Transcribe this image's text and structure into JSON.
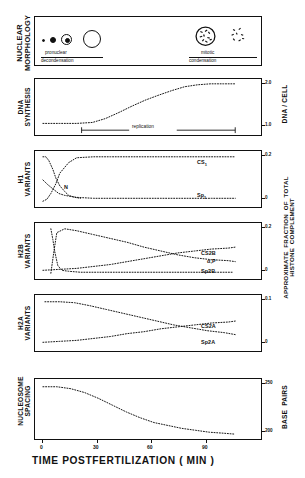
{
  "figure": {
    "xaxis_title": "TIME  POSTFERTILIZATION  ( MIN )",
    "x_ticks": [
      "0",
      "30",
      "60",
      "90"
    ],
    "x_range": [
      -5,
      100
    ]
  },
  "panels": {
    "nuclear_morphology": {
      "left_label": "NUCLEAR\nMORPHOLOGY",
      "caption_left_top": "pronuclear",
      "caption_left_bottom": "decondensation",
      "caption_right_top": "mitotic",
      "caption_right_bottom": "condensation"
    },
    "dna_synthesis": {
      "left_label": "DNA\nSYNTHESIS",
      "right_label": "DNA / CELL",
      "right_ticks": [
        "2.0",
        "1.0"
      ],
      "annotation": "replication"
    },
    "h1_variants": {
      "left_label": "H1\nVARIANTS",
      "right_ticks": [
        "0.2",
        "0"
      ],
      "curve_labels": [
        "CS",
        "Sp",
        "N"
      ],
      "curve_label_cs": "CS",
      "curve_label_cs_sub": "1",
      "curve_label_sp": "Sp",
      "curve_label_sp_sub": "1",
      "curve_label_n": "N"
    },
    "h2b_variants": {
      "left_label": "H2B\nVARIANTS",
      "right_ticks": [
        "0.2",
        "0"
      ],
      "curve_label_cs2b": "CS2B",
      "curve_label_ap": "α,P",
      "curve_label_sp2b": "Sp2B"
    },
    "h2a_variants": {
      "left_label": "H2A\nVARIANTS",
      "right_label": "APPROXIMATE  FRACTION  OF  TOTAL\nHISTONE  COMPLEMENT",
      "right_ticks": [
        "0.1",
        "0"
      ],
      "curve_label_cs2a": "CS2A",
      "curve_label_sp2a": "Sp2A"
    },
    "nucleosome_spacing": {
      "left_label": "NUCLEOSOME\nSPACING",
      "right_label": "BASE  PAIRS",
      "right_ticks": [
        "250",
        "200"
      ]
    }
  },
  "chart_data": {
    "type": "line",
    "title": "",
    "xlabel": "TIME  POSTFERTILIZATION  ( MIN )",
    "xlim": [
      -5,
      100
    ],
    "grid": false,
    "subplots": [
      {
        "name": "dna_synthesis",
        "ylabel": "DNA / CELL",
        "ylim": [
          0.75,
          2.25
        ],
        "yticks": [
          1.0,
          2.0
        ],
        "series": [
          {
            "name": "DNA per cell",
            "style": "dotted",
            "x": [
              0,
              8,
              16,
              24,
              30,
              36,
              42,
              48,
              54,
              60,
              66,
              72,
              78,
              84,
              90
            ],
            "y": [
              1.0,
              1.0,
              1.0,
              1.02,
              1.1,
              1.25,
              1.4,
              1.54,
              1.68,
              1.8,
              1.9,
              1.96,
              2.0,
              2.0,
              2.0
            ]
          }
        ],
        "annotations": [
          {
            "text": "replication",
            "x_start": 26,
            "x_end": 90,
            "y": 0.82
          }
        ]
      },
      {
        "name": "h1_variants",
        "ylim": [
          0,
          0.24
        ],
        "yticks": [
          0,
          0.2
        ],
        "series": [
          {
            "name": "CS1",
            "style": "dotted",
            "x": [
              0,
              3,
              6,
              9,
              12,
              18,
              24,
              36,
              48,
              60,
              72,
              84,
              90
            ],
            "y": [
              0.0,
              0.01,
              0.035,
              0.085,
              0.14,
              0.185,
              0.2,
              0.205,
              0.205,
              0.205,
              0.205,
              0.205,
              0.205
            ]
          },
          {
            "name": "N",
            "style": "dotted",
            "x": [
              0,
              2,
              4,
              6,
              8,
              11,
              14,
              18,
              22,
              26
            ],
            "y": [
              0.2,
              0.2,
              0.185,
              0.15,
              0.115,
              0.08,
              0.055,
              0.035,
              0.025,
              0.02
            ]
          },
          {
            "name": "Sp1",
            "style": "dotted",
            "x": [
              0,
              4,
              8,
              12,
              16,
              24,
              36,
              48,
              60,
              72,
              84,
              90
            ],
            "y": [
              0.085,
              0.065,
              0.045,
              0.03,
              0.022,
              0.015,
              0.012,
              0.012,
              0.012,
              0.012,
              0.012,
              0.012
            ]
          }
        ]
      },
      {
        "name": "h2b_variants",
        "ylim": [
          0,
          0.24
        ],
        "yticks": [
          0,
          0.2
        ],
        "series": [
          {
            "name": "CS2B",
            "style": "dotted",
            "x": [
              4,
              6,
              8,
              12,
              20,
              30,
              40,
              50,
              60,
              68,
              76,
              84,
              90
            ],
            "y": [
              0.0,
              0.09,
              0.175,
              0.2,
              0.19,
              0.175,
              0.158,
              0.14,
              0.122,
              0.108,
              0.098,
              0.09,
              0.086
            ]
          },
          {
            "name": "alpha,P",
            "style": "dotted",
            "x": [
              4,
              5,
              6,
              8,
              14,
              24,
              36,
              48,
              60,
              72,
              84,
              90
            ],
            "y": [
              0.2,
              0.14,
              0.075,
              0.02,
              0.005,
              0.004,
              0.004,
              0.004,
              0.004,
              0.004,
              0.004,
              0.004
            ]
          },
          {
            "name": "Sp2B",
            "style": "dotted",
            "x": [
              0,
              8,
              16,
              24,
              32,
              40,
              50,
              60,
              70,
              80,
              90
            ],
            "y": [
              0.012,
              0.014,
              0.018,
              0.023,
              0.03,
              0.038,
              0.048,
              0.058,
              0.066,
              0.072,
              0.076
            ]
          }
        ]
      },
      {
        "name": "h2a_variants",
        "ylabel": "APPROXIMATE FRACTION OF TOTAL HISTONE COMPLEMENT",
        "ylim": [
          0,
          0.12
        ],
        "yticks": [
          0,
          0.1
        ],
        "series": [
          {
            "name": "CS2A",
            "style": "dotted",
            "x": [
              2,
              8,
              14,
              20,
              28,
              36,
              44,
              52,
              60,
              68,
              76,
              84,
              90
            ],
            "y": [
              0.1,
              0.1,
              0.098,
              0.094,
              0.086,
              0.078,
              0.07,
              0.062,
              0.054,
              0.047,
              0.041,
              0.036,
              0.033
            ]
          },
          {
            "name": "Sp2A",
            "style": "dotted",
            "x": [
              0,
              10,
              20,
              30,
              40,
              50,
              58,
              66,
              74,
              82,
              90
            ],
            "y": [
              0.008,
              0.01,
              0.013,
              0.017,
              0.021,
              0.026,
              0.03,
              0.034,
              0.038,
              0.041,
              0.044
            ]
          }
        ]
      },
      {
        "name": "nucleosome_spacing",
        "ylabel": "BASE PAIRS",
        "ylim": [
          192,
          258
        ],
        "yticks": [
          200,
          250
        ],
        "series": [
          {
            "name": "nucleosome repeat length",
            "style": "dotted",
            "x": [
              0,
              6,
              12,
              18,
              24,
              30,
              36,
              42,
              48,
              54,
              60,
              66,
              72,
              78,
              84
            ],
            "y": [
              249,
              249,
              248,
              245,
              240,
              233,
              226,
              220,
              214,
              210,
              207,
              204,
              202,
              201,
              200
            ]
          }
        ]
      }
    ]
  }
}
